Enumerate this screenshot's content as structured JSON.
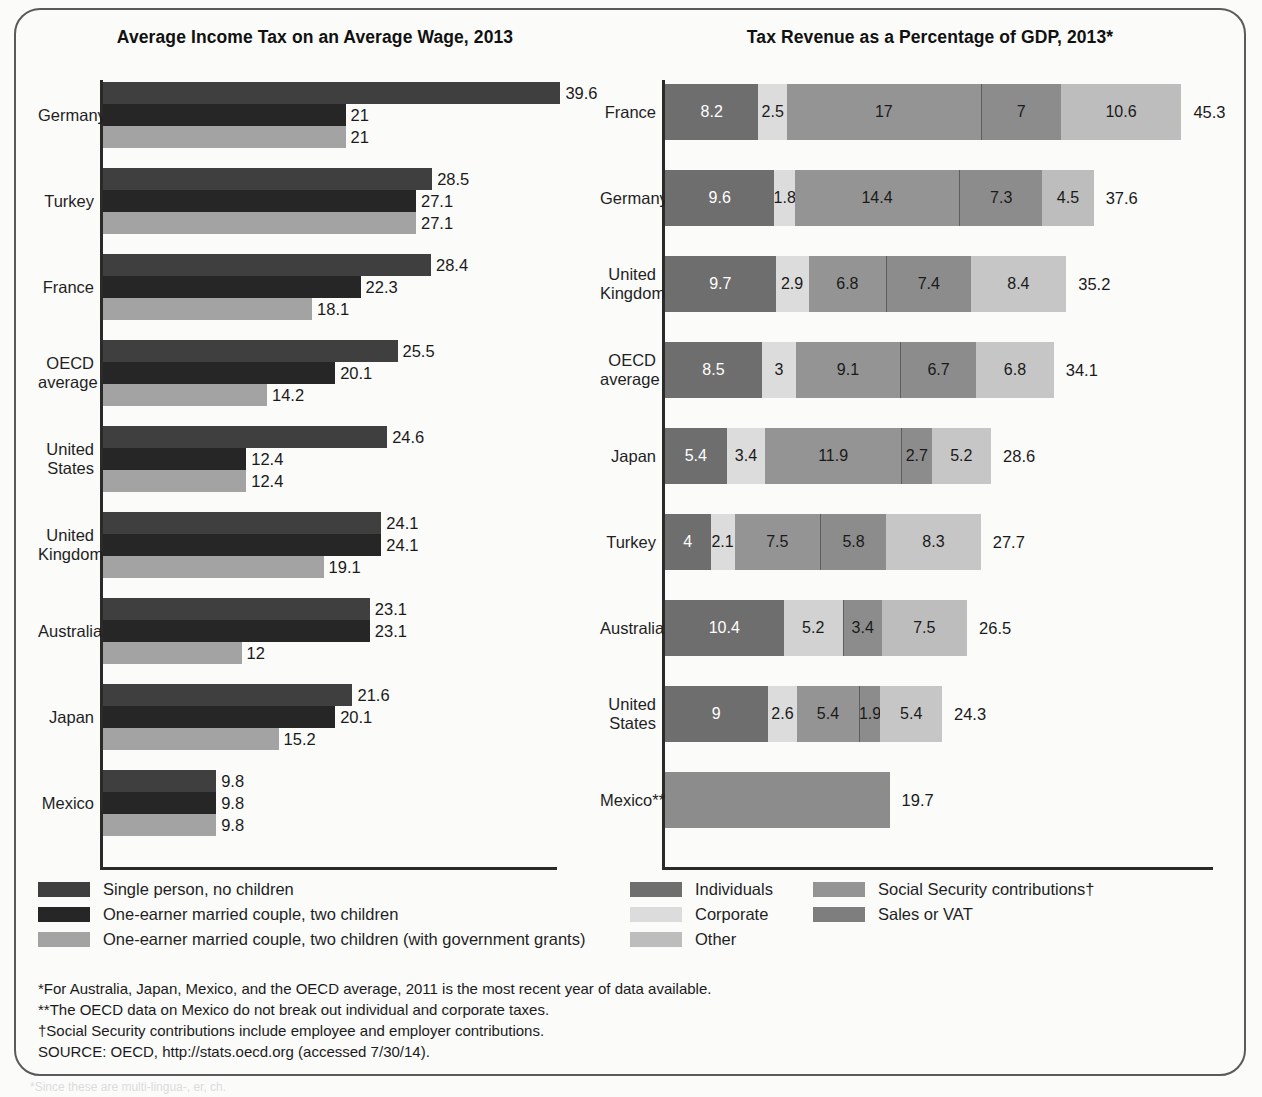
{
  "figure": {
    "edge_note": "*Since these are multi-lingua-, er, ch."
  },
  "left_chart": {
    "title": "Average Income Tax on an Average Wage, 2013",
    "legend": [
      {
        "label": "Single person, no children",
        "color": "#3f3f3f"
      },
      {
        "label": "One-earner married couple, two children",
        "color": "#262626"
      },
      {
        "label": "One-earner married couple, two children (with government grants)",
        "color": "#a3a3a3"
      }
    ]
  },
  "right_chart": {
    "title": "Tax Revenue as a Percentage of GDP, 2013*",
    "legend_col1": [
      {
        "label": "Individuals",
        "color": "#6e6e6e"
      },
      {
        "label": "Corporate",
        "color": "#dcdcdc"
      },
      {
        "label": "Other",
        "color": "#bdbdbd"
      }
    ],
    "legend_col2": [
      {
        "label": "Social Security contributions†",
        "color": "#949494"
      },
      {
        "label": "Sales or VAT",
        "color": "#7e7e7e"
      }
    ]
  },
  "footnotes": [
    "*For Australia, Japan, Mexico, and the OECD average, 2011 is the most recent year of data available.",
    "**The OECD data on Mexico do not break out individual and corporate taxes.",
    "†Social Security contributions include employee and employer contributions.",
    "SOURCE: OECD, http://stats.oecd.org (accessed 7/30/14)."
  ],
  "chart_data": [
    {
      "type": "bar",
      "title": "Average Income Tax on an Average Wage, 2013",
      "orientation": "horizontal",
      "grouped": true,
      "xlabel": "",
      "ylabel": "",
      "xlim": [
        0,
        42
      ],
      "grid": false,
      "legend_position": "below",
      "categories": [
        "Germany",
        "Turkey",
        "France",
        "OECD average",
        "United States",
        "United Kingdom",
        "Australia",
        "Japan",
        "Mexico"
      ],
      "series": [
        {
          "name": "Single person, no children",
          "color": "#3f3f3f",
          "values": [
            39.6,
            28.5,
            28.4,
            25.5,
            24.6,
            24.1,
            23.1,
            21.6,
            9.8
          ]
        },
        {
          "name": "One-earner married couple, two children",
          "color": "#262626",
          "values": [
            21,
            27.1,
            22.3,
            20.1,
            12.4,
            24.1,
            23.1,
            20.1,
            9.8
          ]
        },
        {
          "name": "One-earner married couple, two children (with government grants)",
          "color": "#a3a3a3",
          "values": [
            21,
            27.1,
            18.1,
            14.2,
            12.4,
            19.1,
            12,
            15.2,
            9.8
          ]
        }
      ]
    },
    {
      "type": "bar",
      "title": "Tax Revenue as a Percentage of GDP, 2013*",
      "orientation": "horizontal",
      "stacked": true,
      "xlabel": "",
      "ylabel": "",
      "xlim": [
        0,
        46
      ],
      "grid": false,
      "legend_position": "below",
      "categories": [
        "France",
        "Germany",
        "United Kingdom",
        "OECD average",
        "Japan",
        "Turkey",
        "Australia",
        "United States",
        "Mexico**"
      ],
      "segment_names": [
        "Individuals",
        "Corporate",
        "Social Security contributions†",
        "Sales or VAT",
        "Other"
      ],
      "segment_colors": [
        "#6e6e6e",
        "#dcdcdc",
        "#949494",
        "#7e7e7e",
        "#bdbdbd"
      ],
      "rows": [
        {
          "label": "France",
          "total": 45.3,
          "segments": [
            {
              "name": "Individuals",
              "value": 8.2,
              "color": "#6e6e6e",
              "text": "#ffffff"
            },
            {
              "name": "Corporate",
              "value": 2.5,
              "color": "#dcdcdc",
              "text": "#1a1a1a"
            },
            {
              "name": "Social Security contributions",
              "value": 17,
              "color": "#949494",
              "text": "#1a1a1a"
            },
            {
              "name": "Sales or VAT",
              "value": 7,
              "color": "#8c8c8c",
              "text": "#1a1a1a"
            },
            {
              "name": "Other",
              "value": 10.6,
              "color": "#bdbdbd",
              "text": "#1a1a1a"
            }
          ]
        },
        {
          "label": "Germany",
          "total": 37.6,
          "segments": [
            {
              "name": "Individuals",
              "value": 9.6,
              "color": "#6e6e6e",
              "text": "#ffffff"
            },
            {
              "name": "Corporate",
              "value": 1.8,
              "color": "#dcdcdc",
              "text": "#1a1a1a"
            },
            {
              "name": "Social Security contributions",
              "value": 14.4,
              "color": "#949494",
              "text": "#1a1a1a"
            },
            {
              "name": "Sales or VAT",
              "value": 7.3,
              "color": "#8c8c8c",
              "text": "#1a1a1a"
            },
            {
              "name": "Other",
              "value": 4.5,
              "color": "#bdbdbd",
              "text": "#1a1a1a"
            }
          ]
        },
        {
          "label": "United Kingdom",
          "total": 35.2,
          "segments": [
            {
              "name": "Individuals",
              "value": 9.7,
              "color": "#6e6e6e",
              "text": "#ffffff"
            },
            {
              "name": "Corporate",
              "value": 2.9,
              "color": "#dcdcdc",
              "text": "#1a1a1a"
            },
            {
              "name": "Social Security contributions",
              "value": 6.8,
              "color": "#949494",
              "text": "#1a1a1a"
            },
            {
              "name": "Sales or VAT",
              "value": 7.4,
              "color": "#8c8c8c",
              "text": "#1a1a1a"
            },
            {
              "name": "Other",
              "value": 8.4,
              "color": "#c6c6c6",
              "text": "#1a1a1a"
            }
          ]
        },
        {
          "label": "OECD average",
          "total": 34.1,
          "segments": [
            {
              "name": "Individuals",
              "value": 8.5,
              "color": "#6e6e6e",
              "text": "#ffffff"
            },
            {
              "name": "Corporate",
              "value": 3,
              "color": "#dcdcdc",
              "text": "#1a1a1a"
            },
            {
              "name": "Social Security contributions",
              "value": 9.1,
              "color": "#949494",
              "text": "#1a1a1a"
            },
            {
              "name": "Sales or VAT",
              "value": 6.7,
              "color": "#8c8c8c",
              "text": "#1a1a1a"
            },
            {
              "name": "Other",
              "value": 6.8,
              "color": "#c6c6c6",
              "text": "#1a1a1a"
            }
          ]
        },
        {
          "label": "Japan",
          "total": 28.6,
          "segments": [
            {
              "name": "Individuals",
              "value": 5.4,
              "color": "#6e6e6e",
              "text": "#ffffff"
            },
            {
              "name": "Corporate",
              "value": 3.4,
              "color": "#dcdcdc",
              "text": "#1a1a1a"
            },
            {
              "name": "Social Security contributions",
              "value": 11.9,
              "color": "#949494",
              "text": "#1a1a1a"
            },
            {
              "name": "Sales or VAT",
              "value": 2.7,
              "color": "#8c8c8c",
              "text": "#1a1a1a"
            },
            {
              "name": "Other",
              "value": 5.2,
              "color": "#c6c6c6",
              "text": "#1a1a1a"
            }
          ]
        },
        {
          "label": "Turkey",
          "total": 27.7,
          "segments": [
            {
              "name": "Individuals",
              "value": 4,
              "color": "#6e6e6e",
              "text": "#ffffff"
            },
            {
              "name": "Corporate",
              "value": 2.1,
              "color": "#dcdcdc",
              "text": "#1a1a1a"
            },
            {
              "name": "Social Security contributions",
              "value": 7.5,
              "color": "#949494",
              "text": "#1a1a1a"
            },
            {
              "name": "Sales or VAT",
              "value": 5.8,
              "color": "#8c8c8c",
              "text": "#1a1a1a"
            },
            {
              "name": "Other",
              "value": 8.3,
              "color": "#c6c6c6",
              "text": "#1a1a1a"
            }
          ]
        },
        {
          "label": "Australia",
          "total": 26.5,
          "segments": [
            {
              "name": "Individuals",
              "value": 10.4,
              "color": "#6e6e6e",
              "text": "#ffffff"
            },
            {
              "name": "Corporate",
              "value": 5.2,
              "color": "#d2d2d2",
              "text": "#1a1a1a"
            },
            {
              "name": "Sales or VAT",
              "value": 3.4,
              "color": "#8c8c8c",
              "text": "#1a1a1a"
            },
            {
              "name": "Other",
              "value": 7.5,
              "color": "#bdbdbd",
              "text": "#1a1a1a"
            }
          ]
        },
        {
          "label": "United States",
          "total": 24.3,
          "segments": [
            {
              "name": "Individuals",
              "value": 9,
              "color": "#6e6e6e",
              "text": "#ffffff"
            },
            {
              "name": "Corporate",
              "value": 2.6,
              "color": "#dcdcdc",
              "text": "#1a1a1a"
            },
            {
              "name": "Social Security contributions",
              "value": 5.4,
              "color": "#949494",
              "text": "#1a1a1a"
            },
            {
              "name": "Sales or VAT",
              "value": 1.9,
              "color": "#8c8c8c",
              "text": "#1a1a1a"
            },
            {
              "name": "Other",
              "value": 5.4,
              "color": "#c6c6c6",
              "text": "#1a1a1a"
            }
          ]
        },
        {
          "label": "Mexico**",
          "total": 19.7,
          "segments": [
            {
              "name": "Total",
              "value": 19.7,
              "color": "#8c8c8c",
              "text": "#8c8c8c"
            }
          ]
        }
      ]
    }
  ]
}
